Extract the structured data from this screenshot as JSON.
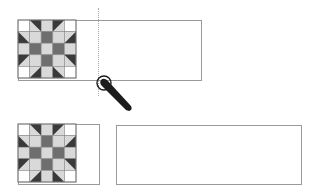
{
  "diagram": {
    "title": "",
    "colors": {
      "dark": "#3a3a3a",
      "medium": "#6e6e6e",
      "light": "#d9d9d9",
      "white": "#ffffff",
      "border": "#9a9a9a",
      "guide": "#a8a8a8",
      "pen": "#1c1c1c"
    },
    "quilt_block": {
      "grid": 5,
      "cells": [
        [
          "w",
          "tri-tr",
          "l",
          "tri-tl",
          "w"
        ],
        [
          "tri-bl",
          "l",
          "m",
          "l",
          "tri-br"
        ],
        [
          "l",
          "m",
          "l",
          "m",
          "l"
        ],
        [
          "tri-tl2",
          "l",
          "m",
          "l",
          "tri-tr2"
        ],
        [
          "w",
          "tri-br2",
          "l",
          "tri-bl2",
          "w"
        ]
      ]
    },
    "panels": [
      {
        "name": "before",
        "block": {
          "x": 18,
          "y": 20,
          "size": 58
        },
        "frame": {
          "x": 18,
          "y": 20,
          "w": 184,
          "h": 61
        },
        "guide": {
          "x": 98,
          "y1": 8,
          "y2": 96
        },
        "handle": {
          "cx": 104,
          "cy": 83,
          "r": 7,
          "icon": "stylus-pointer-icon"
        }
      },
      {
        "name": "after",
        "block": {
          "x": 18,
          "y": 124,
          "size": 58
        },
        "frame": {
          "x": 18,
          "y": 124,
          "w": 82,
          "h": 61
        },
        "separate_box": {
          "x": 116,
          "y": 125,
          "w": 186,
          "h": 60
        }
      }
    ]
  }
}
